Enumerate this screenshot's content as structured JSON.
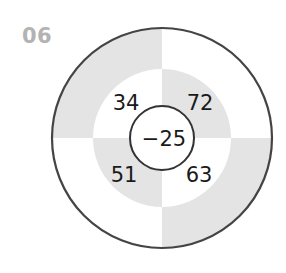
{
  "problem_label": "06",
  "diagram": {
    "center_value": "−25",
    "quadrant_values": {
      "top_left": "34",
      "top_right": "72",
      "bottom_left": "51",
      "bottom_right": "63"
    },
    "colors": {
      "shade": "#e4e4e4",
      "white": "#ffffff",
      "stroke": "#444444",
      "label": "#b3b3b3"
    },
    "outer_ring_shading": {
      "top_left": "shade",
      "top_right": "white",
      "bottom_left": "white",
      "bottom_right": "shade"
    },
    "middle_ring_shading": {
      "top_left": "white",
      "top_right": "shade",
      "bottom_left": "shade",
      "bottom_right": "white"
    }
  }
}
